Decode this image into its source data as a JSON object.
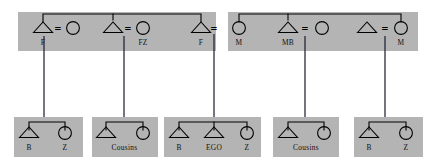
{
  "diagram": {
    "canvas": {
      "width": 427,
      "height": 167
    },
    "colors": {
      "box_fill": "#b4b4b4",
      "line": "#000000",
      "descent_line": "#1a1a2e",
      "background": "#ffffff",
      "label": "#111111"
    },
    "marriage_symbol": "=",
    "ego_label": "EGO",
    "parent_generation": {
      "boxes": [
        {
          "name": "fathers-side-box",
          "x": 18,
          "y": 12,
          "width": 198,
          "height": 39,
          "persons": [
            {
              "symbol": "triangle",
              "label": "F",
              "cx": 43,
              "cy": 28
            },
            {
              "symbol": "circle",
              "label": "",
              "cx": 73,
              "cy": 28
            },
            {
              "symbol": "triangle",
              "label": "",
              "cx": 113,
              "cy": 28
            },
            {
              "symbol": "circle",
              "label": "FZ",
              "cx": 143,
              "cy": 28
            },
            {
              "symbol": "triangle",
              "label": "F",
              "cx": 201,
              "cy": 28
            }
          ],
          "marriages": [
            {
              "label": "=",
              "x": 58,
              "y": 29
            },
            {
              "label": "=",
              "x": 128,
              "y": 29
            }
          ]
        },
        {
          "name": "mothers-side-box",
          "x": 228,
          "y": 12,
          "width": 190,
          "height": 39,
          "persons": [
            {
              "symbol": "circle",
              "label": "M",
              "cx": 239,
              "cy": 28
            },
            {
              "symbol": "triangle",
              "label": "MB",
              "cx": 288,
              "cy": 28
            },
            {
              "symbol": "circle",
              "label": "",
              "cx": 322,
              "cy": 28
            },
            {
              "symbol": "triangle",
              "label": "",
              "cx": 367,
              "cy": 28
            },
            {
              "symbol": "circle",
              "label": "M",
              "cx": 401,
              "cy": 28
            }
          ],
          "marriages": [
            {
              "label": "=",
              "x": 305,
              "y": 29
            },
            {
              "label": "=",
              "x": 385,
              "y": 29
            }
          ]
        }
      ],
      "central_marriage": {
        "label": "=",
        "x": 214,
        "y": 29
      }
    },
    "descent_lines": [
      {
        "name": "descent-line-1",
        "x": 44,
        "y1": 36,
        "y2": 117
      },
      {
        "name": "descent-line-2",
        "x": 124,
        "y1": 36,
        "y2": 117
      },
      {
        "name": "descent-line-3",
        "x": 214,
        "y1": 34,
        "y2": 117
      },
      {
        "name": "descent-line-4",
        "x": 305,
        "y1": 36,
        "y2": 117
      },
      {
        "name": "descent-line-5",
        "x": 385,
        "y1": 36,
        "y2": 117
      }
    ],
    "child_generation": {
      "boxes": [
        {
          "name": "ego-siblings-left-box",
          "x": 14,
          "y": 117,
          "width": 69,
          "height": 40,
          "drop_x": 44,
          "children": [
            {
              "symbol": "triangle",
              "label": "B",
              "cx": 29,
              "cy": 133
            },
            {
              "symbol": "circle",
              "label": "Z",
              "cx": 65,
              "cy": 133
            }
          ],
          "group_label": null
        },
        {
          "name": "fathers-sister-children-box",
          "x": 92,
          "y": 117,
          "width": 66,
          "height": 40,
          "drop_x": 124,
          "children": [
            {
              "symbol": "triangle",
              "label": "",
              "cx": 106,
              "cy": 133
            },
            {
              "symbol": "circle",
              "label": "",
              "cx": 143,
              "cy": 133
            }
          ],
          "group_label": "Cousins"
        },
        {
          "name": "ego-box",
          "x": 164,
          "y": 117,
          "width": 97,
          "height": 40,
          "drop_x": 214,
          "children": [
            {
              "symbol": "triangle",
              "label": "B",
              "cx": 179,
              "cy": 133
            },
            {
              "symbol": "triangle",
              "label": "EGO",
              "cx": 214,
              "cy": 133
            },
            {
              "symbol": "circle",
              "label": "Z",
              "cx": 247,
              "cy": 133
            }
          ],
          "group_label": null
        },
        {
          "name": "mothers-brother-children-box",
          "x": 273,
          "y": 117,
          "width": 66,
          "height": 40,
          "drop_x": 305,
          "children": [
            {
              "symbol": "triangle",
              "label": "",
              "cx": 288,
              "cy": 133
            },
            {
              "symbol": "circle",
              "label": "",
              "cx": 324,
              "cy": 133
            }
          ],
          "group_label": "Cousins"
        },
        {
          "name": "ego-siblings-right-box",
          "x": 354,
          "y": 117,
          "width": 69,
          "height": 40,
          "drop_x": 385,
          "children": [
            {
              "symbol": "triangle",
              "label": "B",
              "cx": 369,
              "cy": 133
            },
            {
              "symbol": "circle",
              "label": "Z",
              "cx": 406,
              "cy": 133
            }
          ],
          "group_label": null
        }
      ]
    },
    "sibling_bars": [
      {
        "name": "sibling-bar-fathers-side",
        "x1": 43,
        "x2": 201,
        "y": 14,
        "drop_x": 113,
        "drop_y": 20
      },
      {
        "name": "sibling-bar-mothers-side",
        "x1": 239,
        "x2": 401,
        "y": 14,
        "drop_x": 288,
        "drop_y": 20
      }
    ]
  }
}
